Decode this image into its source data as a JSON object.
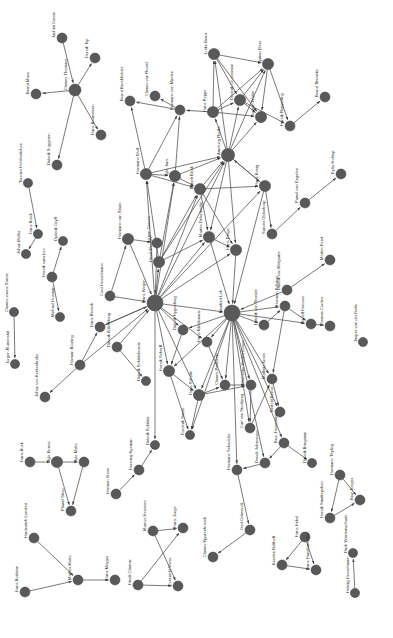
{
  "figure": {
    "type": "network-graph",
    "title": "",
    "background": "#ffffff",
    "node_color": "#595959",
    "edge_color": "#4d4d4d",
    "label_color": "#2b2b2b",
    "label_rotation_deg": -90,
    "directed": true
  },
  "chart_data": {
    "type": "network",
    "title": "",
    "xlabel": "",
    "ylabel": "",
    "grid": false,
    "legend": "none",
    "nodes": [
      {
        "id": 0,
        "label": "Jachim Garcio",
        "x": 62,
        "y": 38,
        "r": 5.0
      },
      {
        "id": 1,
        "label": "Clawes Thomass",
        "x": 75,
        "y": 90,
        "r": 6.0
      },
      {
        "id": 2,
        "label": "Henrik Top",
        "x": 95,
        "y": 58,
        "r": 5.0
      },
      {
        "id": 3,
        "label": "Bernd Mass",
        "x": 36,
        "y": 94,
        "r": 5.0
      },
      {
        "id": 4,
        "label": "Diderik Suggeren",
        "x": 57,
        "y": 165,
        "r": 5.0
      },
      {
        "id": 5,
        "label": "Hans Brumsteen",
        "x": 101,
        "y": 135,
        "r": 5.0
      },
      {
        "id": 6,
        "label": "Tonnies Holshorlichoe",
        "x": 28,
        "y": 183,
        "r": 4.6
      },
      {
        "id": 7,
        "label": "Hans Brock",
        "x": 38,
        "y": 234,
        "r": 4.6
      },
      {
        "id": 8,
        "label": "Johan Moller",
        "x": 26,
        "y": 254,
        "r": 4.6
      },
      {
        "id": 9,
        "label": "Henrik vam Loo",
        "x": 52,
        "y": 277,
        "r": 5.0
      },
      {
        "id": 10,
        "label": "Dyderik Gryff",
        "x": 63,
        "y": 241,
        "r": 4.6
      },
      {
        "id": 11,
        "label": "Michael Husman",
        "x": 60,
        "y": 317,
        "r": 4.6
      },
      {
        "id": 12,
        "label": "Clawes vanne Sande",
        "x": 14,
        "y": 312,
        "r": 4.6
      },
      {
        "id": 13,
        "label": "Jurgen Rumenstal",
        "x": 15,
        "y": 364,
        "r": 4.6
      },
      {
        "id": 14,
        "label": "Herman Bruning",
        "x": 80,
        "y": 365,
        "r": 5.0
      },
      {
        "id": 15,
        "label": "Johan von Kerkenbroke",
        "x": 45,
        "y": 397,
        "r": 5.0
      },
      {
        "id": 16,
        "label": "Cord Hesselmann",
        "x": 110,
        "y": 296,
        "r": 5.0
      },
      {
        "id": 17,
        "label": "Hermann van Stade",
        "x": 128,
        "y": 239,
        "r": 5.6
      },
      {
        "id": 18,
        "label": "Jurgen Greven",
        "x": 157,
        "y": 243,
        "r": 5.0
      },
      {
        "id": 19,
        "label": "Hans Roveck",
        "x": 100,
        "y": 327,
        "r": 5.0
      },
      {
        "id": 20,
        "label": "Diderik Wilsenberg",
        "x": 117,
        "y": 347,
        "r": 5.0
      },
      {
        "id": 21,
        "label": "Diderik Schildebrorde",
        "x": 146,
        "y": 381,
        "r": 4.6
      },
      {
        "id": 22,
        "label": "Hans Wegen",
        "x": 155,
        "y": 303,
        "r": 8.0
      },
      {
        "id": 23,
        "label": "Hinrik Meyger",
        "x": 159,
        "y": 262,
        "r": 5.6
      },
      {
        "id": 24,
        "label": "Hermann Wulf",
        "x": 146,
        "y": 174,
        "r": 5.6
      },
      {
        "id": 25,
        "label": "Tyle Jans",
        "x": 175,
        "y": 176,
        "r": 5.6
      },
      {
        "id": 26,
        "label": "Everdt Block",
        "x": 200,
        "y": 189,
        "r": 5.6
      },
      {
        "id": 27,
        "label": "Amelung Reriks",
        "x": 228,
        "y": 155,
        "r": 6.6
      },
      {
        "id": 28,
        "label": "Hans Poppe",
        "x": 213,
        "y": 112,
        "r": 5.6
      },
      {
        "id": 29,
        "label": "Hermann von Minden",
        "x": 180,
        "y": 110,
        "r": 5.0
      },
      {
        "id": 30,
        "label": "Clawes van Rostel",
        "x": 155,
        "y": 96,
        "r": 5.0
      },
      {
        "id": 31,
        "label": "Bernd Broekholder",
        "x": 130,
        "y": 101,
        "r": 5.0
      },
      {
        "id": 32,
        "label": "Lutke Brant",
        "x": 214,
        "y": 54,
        "r": 5.6
      },
      {
        "id": 33,
        "label": "Dederik Crucceman",
        "x": 240,
        "y": 100,
        "r": 5.6
      },
      {
        "id": 34,
        "label": "Syman Elers",
        "x": 268,
        "y": 64,
        "r": 5.6
      },
      {
        "id": 35,
        "label": "Gorgen Walde",
        "x": 261,
        "y": 117,
        "r": 5.6
      },
      {
        "id": 36,
        "label": "Henrik Reppeding",
        "x": 290,
        "y": 126,
        "r": 5.0
      },
      {
        "id": 37,
        "label": "Bernd Titsewitz",
        "x": 325,
        "y": 97,
        "r": 5.0
      },
      {
        "id": 38,
        "label": "Hans Konig",
        "x": 265,
        "y": 186,
        "r": 5.6
      },
      {
        "id": 39,
        "label": "Sander Oldenborp",
        "x": 272,
        "y": 234,
        "r": 5.0
      },
      {
        "id": 40,
        "label": "Pawel van Engelen",
        "x": 305,
        "y": 203,
        "r": 5.0
      },
      {
        "id": 41,
        "label": "Eyler Holtrop",
        "x": 341,
        "y": 174,
        "r": 5.0
      },
      {
        "id": 42,
        "label": "Morten Ferst",
        "x": 330,
        "y": 260,
        "r": 5.0
      },
      {
        "id": 43,
        "label": "Diderik von Melgarter",
        "x": 287,
        "y": 290,
        "r": 5.0
      },
      {
        "id": 44,
        "label": "Marten Delenwolde",
        "x": 209,
        "y": 237,
        "r": 5.6
      },
      {
        "id": 45,
        "label": "Hans Droge",
        "x": 236,
        "y": 250,
        "r": 5.6
      },
      {
        "id": 46,
        "label": "Lambert Loh",
        "x": 232,
        "y": 313,
        "r": 8.0
      },
      {
        "id": 47,
        "label": "Diderik Hygenberg",
        "x": 183,
        "y": 330,
        "r": 5.0
      },
      {
        "id": 48,
        "label": "Henrik Scherff",
        "x": 169,
        "y": 371,
        "r": 5.6
      },
      {
        "id": 49,
        "label": "Hans Schulte",
        "x": 199,
        "y": 395,
        "r": 5.6
      },
      {
        "id": 50,
        "label": "Frederik Sasse",
        "x": 190,
        "y": 435,
        "r": 4.6
      },
      {
        "id": 51,
        "label": "Hans Kilrickmade",
        "x": 207,
        "y": 342,
        "r": 5.0
      },
      {
        "id": 52,
        "label": "Clawes Parkentin",
        "x": 225,
        "y": 385,
        "r": 5.0
      },
      {
        "id": 53,
        "label": "Wernecke Werkenhusen",
        "x": 251,
        "y": 385,
        "r": 5.0
      },
      {
        "id": 54,
        "label": "Carl von Stockjeng",
        "x": 250,
        "y": 428,
        "r": 5.0
      },
      {
        "id": 55,
        "label": "Mathias Krone",
        "x": 272,
        "y": 379,
        "r": 5.0
      },
      {
        "id": 56,
        "label": "Bertold Bense",
        "x": 280,
        "y": 412,
        "r": 5.0
      },
      {
        "id": 57,
        "label": "Diderik von Stendal",
        "x": 264,
        "y": 325,
        "r": 5.0
      },
      {
        "id": 58,
        "label": "Hermen Schriver",
        "x": 285,
        "y": 306,
        "r": 5.0
      },
      {
        "id": 59,
        "label": "Rudolf Hornsee",
        "x": 311,
        "y": 324,
        "r": 5.0
      },
      {
        "id": 60,
        "label": "Thomas Cordes",
        "x": 330,
        "y": 326,
        "r": 5.0
      },
      {
        "id": 61,
        "label": "Jasper van der Nette",
        "x": 363,
        "y": 342,
        "r": 4.6
      },
      {
        "id": 62,
        "label": "Diderik Bringman",
        "x": 312,
        "y": 463,
        "r": 4.6
      },
      {
        "id": 63,
        "label": "Brun Hovemann",
        "x": 284,
        "y": 443,
        "r": 5.0
      },
      {
        "id": 64,
        "label": "Derick Johannsen",
        "x": 265,
        "y": 463,
        "r": 5.0
      },
      {
        "id": 65,
        "label": "Hermann Schodeler",
        "x": 237,
        "y": 470,
        "r": 5.0
      },
      {
        "id": 66,
        "label": "Gert Gdwrenck",
        "x": 250,
        "y": 530,
        "r": 5.0
      },
      {
        "id": 67,
        "label": "Clawes Kjystenbuerck",
        "x": 213,
        "y": 557,
        "r": 5.0
      },
      {
        "id": 68,
        "label": "Hans Hanehandeken",
        "x": 316,
        "y": 570,
        "r": 5.0
      },
      {
        "id": 69,
        "label": "Hans Hekel",
        "x": 305,
        "y": 537,
        "r": 5.0
      },
      {
        "id": 70,
        "label": "Kersten Belthoft",
        "x": 282,
        "y": 565,
        "r": 5.0
      },
      {
        "id": 71,
        "label": "Hermann Thyling",
        "x": 340,
        "y": 475,
        "r": 5.0
      },
      {
        "id": 72,
        "label": "Henrik Smaltepoken",
        "x": 330,
        "y": 518,
        "r": 5.0
      },
      {
        "id": 73,
        "label": "Brun Kroger",
        "x": 360,
        "y": 500,
        "r": 5.0
      },
      {
        "id": 74,
        "label": "Helmig Hesselmann",
        "x": 355,
        "y": 593,
        "r": 4.6
      },
      {
        "id": 75,
        "label": "Dirck Waldemschade",
        "x": 353,
        "y": 553,
        "r": 4.6
      },
      {
        "id": 76,
        "label": "Hans Buck",
        "x": 30,
        "y": 462,
        "r": 5.0
      },
      {
        "id": 77,
        "label": "Tyle Korner",
        "x": 57,
        "y": 462,
        "r": 5.6
      },
      {
        "id": 78,
        "label": "Tyle Molre",
        "x": 84,
        "y": 462,
        "r": 5.0
      },
      {
        "id": 79,
        "label": "Plawel Steer",
        "x": 71,
        "y": 511,
        "r": 5.0
      },
      {
        "id": 80,
        "label": "Hardnwich Lensted",
        "x": 34,
        "y": 538,
        "r": 5.0
      },
      {
        "id": 81,
        "label": "Hans Borlemn",
        "x": 25,
        "y": 592,
        "r": 5.0
      },
      {
        "id": 82,
        "label": "Mathes Molre",
        "x": 78,
        "y": 580,
        "r": 5.0
      },
      {
        "id": 83,
        "label": "Hans Meyger",
        "x": 115,
        "y": 580,
        "r": 5.0
      },
      {
        "id": 84,
        "label": "Hermen Vrese",
        "x": 116,
        "y": 494,
        "r": 5.0
      },
      {
        "id": 85,
        "label": "Henning Nyeman",
        "x": 139,
        "y": 470,
        "r": 5.0
      },
      {
        "id": 86,
        "label": "Diderik Schilder",
        "x": 155,
        "y": 445,
        "r": 4.6
      },
      {
        "id": 87,
        "label": "Marcus Heossen",
        "x": 153,
        "y": 531,
        "r": 5.0
      },
      {
        "id": 88,
        "label": "Hinrik Gladow",
        "x": 138,
        "y": 585,
        "r": 5.0
      },
      {
        "id": 89,
        "label": "Everwold Vrese",
        "x": 178,
        "y": 586,
        "r": 5.0
      },
      {
        "id": 90,
        "label": "Hans Junge",
        "x": 183,
        "y": 528,
        "r": 5.0
      }
    ],
    "edges": [
      [
        0,
        1
      ],
      [
        1,
        2
      ],
      [
        1,
        3
      ],
      [
        1,
        4
      ],
      [
        1,
        5
      ],
      [
        6,
        7
      ],
      [
        7,
        8
      ],
      [
        9,
        10
      ],
      [
        9,
        11
      ],
      [
        12,
        13
      ],
      [
        14,
        15
      ],
      [
        14,
        19
      ],
      [
        16,
        17
      ],
      [
        17,
        18
      ],
      [
        16,
        22
      ],
      [
        17,
        22
      ],
      [
        18,
        22
      ],
      [
        19,
        22
      ],
      [
        20,
        22
      ],
      [
        20,
        21
      ],
      [
        14,
        22
      ],
      [
        22,
        23
      ],
      [
        22,
        46
      ],
      [
        22,
        47
      ],
      [
        22,
        48
      ],
      [
        22,
        49
      ],
      [
        22,
        44
      ],
      [
        22,
        45
      ],
      [
        22,
        26
      ],
      [
        22,
        24
      ],
      [
        22,
        25
      ],
      [
        22,
        51
      ],
      [
        22,
        27
      ],
      [
        22,
        38
      ],
      [
        22,
        19
      ],
      [
        22,
        86
      ],
      [
        23,
        24
      ],
      [
        23,
        25
      ],
      [
        23,
        26
      ],
      [
        23,
        27
      ],
      [
        23,
        44
      ],
      [
        24,
        25
      ],
      [
        24,
        26
      ],
      [
        24,
        27
      ],
      [
        24,
        29
      ],
      [
        24,
        31
      ],
      [
        25,
        26
      ],
      [
        25,
        27
      ],
      [
        25,
        29
      ],
      [
        26,
        27
      ],
      [
        26,
        44
      ],
      [
        26,
        45
      ],
      [
        26,
        38
      ],
      [
        27,
        28
      ],
      [
        27,
        33
      ],
      [
        27,
        35
      ],
      [
        27,
        38
      ],
      [
        27,
        44
      ],
      [
        27,
        45
      ],
      [
        27,
        32
      ],
      [
        27,
        34
      ],
      [
        28,
        29
      ],
      [
        28,
        32
      ],
      [
        28,
        33
      ],
      [
        28,
        34
      ],
      [
        28,
        35
      ],
      [
        29,
        30
      ],
      [
        29,
        31
      ],
      [
        32,
        33
      ],
      [
        32,
        34
      ],
      [
        32,
        35
      ],
      [
        33,
        34
      ],
      [
        33,
        35
      ],
      [
        33,
        36
      ],
      [
        34,
        35
      ],
      [
        34,
        36
      ],
      [
        36,
        37
      ],
      [
        38,
        39
      ],
      [
        38,
        46
      ],
      [
        38,
        27
      ],
      [
        39,
        40
      ],
      [
        40,
        41
      ],
      [
        43,
        42
      ],
      [
        43,
        46
      ],
      [
        44,
        45
      ],
      [
        44,
        46
      ],
      [
        45,
        46
      ],
      [
        46,
        47
      ],
      [
        46,
        48
      ],
      [
        46,
        49
      ],
      [
        46,
        51
      ],
      [
        46,
        52
      ],
      [
        46,
        53
      ],
      [
        46,
        54
      ],
      [
        46,
        55
      ],
      [
        46,
        56
      ],
      [
        46,
        57
      ],
      [
        46,
        58
      ],
      [
        46,
        59
      ],
      [
        46,
        63
      ],
      [
        46,
        64
      ],
      [
        46,
        65
      ],
      [
        46,
        50
      ],
      [
        47,
        48
      ],
      [
        48,
        49
      ],
      [
        48,
        50
      ],
      [
        49,
        50
      ],
      [
        49,
        52
      ],
      [
        49,
        53
      ],
      [
        51,
        52
      ],
      [
        52,
        53
      ],
      [
        53,
        54
      ],
      [
        54,
        55
      ],
      [
        55,
        56
      ],
      [
        57,
        58
      ],
      [
        58,
        59
      ],
      [
        58,
        55
      ],
      [
        59,
        60
      ],
      [
        63,
        64
      ],
      [
        63,
        62
      ],
      [
        64,
        65
      ],
      [
        65,
        66
      ],
      [
        66,
        67
      ],
      [
        69,
        70
      ],
      [
        70,
        68
      ],
      [
        69,
        68
      ],
      [
        71,
        72
      ],
      [
        71,
        73
      ],
      [
        72,
        73
      ],
      [
        74,
        75
      ],
      [
        76,
        77
      ],
      [
        77,
        78
      ],
      [
        77,
        79
      ],
      [
        78,
        79
      ],
      [
        80,
        82
      ],
      [
        81,
        82
      ],
      [
        82,
        83
      ],
      [
        84,
        85
      ],
      [
        85,
        86
      ],
      [
        87,
        90
      ],
      [
        87,
        89
      ],
      [
        88,
        89
      ],
      [
        88,
        90
      ]
    ]
  }
}
